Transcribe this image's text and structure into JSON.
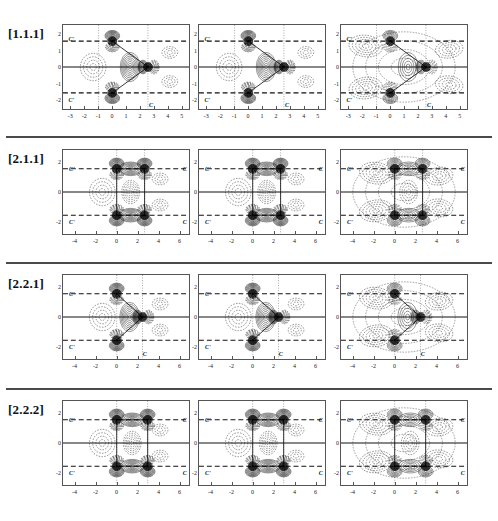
{
  "figure": {
    "rows": [
      {
        "label": "[1.1.1]",
        "xticks": [
          "-3",
          "-2",
          "-1",
          "0",
          "1",
          "2",
          "3",
          "4",
          "5"
        ],
        "xtick_values": [
          -3,
          -2,
          -1,
          0,
          1,
          2,
          3,
          4,
          5
        ],
        "yticks": [
          "2",
          "1",
          "0",
          "-1",
          "-2"
        ],
        "ytick_values": [
          2,
          1,
          0,
          -1,
          -2
        ],
        "xlim": [
          -3.6,
          5.6
        ],
        "ylim": [
          -2.6,
          2.6
        ],
        "annotations": [
          {
            "text": "C'",
            "x": -3.0,
            "y": 1.75
          },
          {
            "text": "C'",
            "x": -3.0,
            "y": -1.95
          },
          {
            "text": "C",
            "x": 2.72,
            "y": -2.25
          }
        ],
        "panels": [
          {
            "name": "panel-1-1",
            "style": "tight-triangle"
          },
          {
            "name": "panel-1-2",
            "style": "tight-triangle"
          },
          {
            "name": "panel-1-3",
            "style": "diffuse-triangle"
          }
        ]
      },
      {
        "label": "[2.1.1]",
        "xticks": [
          "-4",
          "-2",
          "0",
          "2",
          "4",
          "6"
        ],
        "xtick_values": [
          -4,
          -2,
          0,
          2,
          4,
          6
        ],
        "yticks": [
          "2",
          "0",
          "-2"
        ],
        "ytick_values": [
          2,
          0,
          -2
        ],
        "xlim": [
          -5.2,
          7.0
        ],
        "ylim": [
          -2.9,
          2.9
        ],
        "annotations": [
          {
            "text": "C'",
            "x": -4.35,
            "y": 1.62
          },
          {
            "text": "C'",
            "x": -4.35,
            "y": -1.95
          },
          {
            "text": "C",
            "x": 6.4,
            "y": 1.62
          },
          {
            "text": "C",
            "x": 6.4,
            "y": -1.95
          }
        ],
        "panels": [
          {
            "name": "panel-2-1",
            "style": "tight-rect"
          },
          {
            "name": "panel-2-2",
            "style": "tight-rect"
          },
          {
            "name": "panel-2-3",
            "style": "diffuse-rect"
          }
        ]
      },
      {
        "label": "[2.2.1]",
        "xticks": [
          "-4",
          "-2",
          "0",
          "2",
          "4",
          "6"
        ],
        "xtick_values": [
          -4,
          -2,
          0,
          2,
          4,
          6
        ],
        "yticks": [
          "2",
          "0",
          "-2"
        ],
        "ytick_values": [
          2,
          0,
          -2
        ],
        "xlim": [
          -5.2,
          7.0
        ],
        "ylim": [
          -2.9,
          2.9
        ],
        "annotations": [
          {
            "text": "C'",
            "x": -4.35,
            "y": 1.62
          },
          {
            "text": "C'",
            "x": -4.35,
            "y": -1.95
          },
          {
            "text": "C",
            "x": 2.6,
            "y": -2.45
          }
        ],
        "panels": [
          {
            "name": "panel-3-1",
            "style": "tight-triangle2"
          },
          {
            "name": "panel-3-2",
            "style": "tight-triangle2"
          },
          {
            "name": "panel-3-3",
            "style": "diffuse-triangle2"
          }
        ]
      },
      {
        "label": "[2.2.2]",
        "xticks": [
          "-4",
          "-2",
          "0",
          "2",
          "4",
          "6"
        ],
        "xtick_values": [
          -4,
          -2,
          0,
          2,
          4,
          6
        ],
        "yticks": [
          "2",
          "0",
          "-2"
        ],
        "ytick_values": [
          2,
          0,
          -2
        ],
        "xlim": [
          -5.2,
          7.0
        ],
        "ylim": [
          -2.9,
          2.9
        ],
        "annotations": [
          {
            "text": "C'",
            "x": -4.35,
            "y": 1.62
          },
          {
            "text": "C'",
            "x": -4.35,
            "y": -1.95
          },
          {
            "text": "C",
            "x": 6.4,
            "y": 1.62
          },
          {
            "text": "C",
            "x": 6.4,
            "y": -1.95
          }
        ],
        "panels": [
          {
            "name": "panel-4-1",
            "style": "tight-rect2"
          },
          {
            "name": "panel-4-2",
            "style": "tight-rect2"
          },
          {
            "name": "panel-4-3",
            "style": "diffuse-rect2"
          }
        ]
      }
    ]
  },
  "chart_data": {
    "type": "contour",
    "title": "",
    "xlabel": "",
    "ylabel": "",
    "grid": false,
    "legend": null,
    "rows": [
      {
        "label": "[1.1.1]",
        "xlim": [
          -3.6,
          5.6
        ],
        "ylim": [
          -2.6,
          2.6
        ],
        "xticks": [
          -3,
          -2,
          -1,
          0,
          1,
          2,
          3,
          4,
          5
        ],
        "yticks": [
          2,
          1,
          0,
          -1,
          -2
        ],
        "molecule": "triangle",
        "atoms": [
          {
            "label": "C'",
            "x": 0.0,
            "y": 1.6
          },
          {
            "label": "C'",
            "x": 0.0,
            "y": -1.6
          },
          {
            "label": "C",
            "x": 2.6,
            "y": 0.0
          }
        ],
        "bonds": [
          [
            0,
            2
          ],
          [
            1,
            2
          ]
        ],
        "reference_lines": {
          "dashed_horizontal": [
            1.6,
            -1.6
          ],
          "dotted_vertical": [
            -1.0,
            2.6
          ],
          "solid_horizontal": [
            0.0
          ]
        },
        "columns": [
          "contracted",
          "contracted",
          "diffuse"
        ]
      },
      {
        "label": "[2.1.1]",
        "xlim": [
          -5.2,
          7.0
        ],
        "ylim": [
          -2.9,
          2.9
        ],
        "xticks": [
          -4,
          -2,
          0,
          2,
          4,
          6
        ],
        "yticks": [
          2,
          0,
          -2
        ],
        "molecule": "rectangle",
        "atoms": [
          {
            "label": "C'",
            "x": 0.0,
            "y": 1.6
          },
          {
            "label": "C'",
            "x": 0.0,
            "y": -1.6
          },
          {
            "label": "C",
            "x": 2.7,
            "y": 1.6
          },
          {
            "label": "C",
            "x": 2.7,
            "y": -1.6
          }
        ],
        "bonds": [
          [
            0,
            2
          ],
          [
            1,
            3
          ],
          [
            0,
            1
          ],
          [
            2,
            3
          ]
        ],
        "reference_lines": {
          "dashed_horizontal": [
            1.6,
            -1.6
          ],
          "dotted_vertical": [
            0.0,
            2.7
          ],
          "solid_horizontal": [
            0.0
          ]
        },
        "columns": [
          "contracted",
          "contracted",
          "diffuse"
        ]
      },
      {
        "label": "[2.2.1]",
        "xlim": [
          -5.2,
          7.0
        ],
        "ylim": [
          -2.9,
          2.9
        ],
        "xticks": [
          -4,
          -2,
          0,
          2,
          4,
          6
        ],
        "yticks": [
          2,
          0,
          -2
        ],
        "molecule": "triangle",
        "atoms": [
          {
            "label": "C'",
            "x": 0.0,
            "y": 1.6
          },
          {
            "label": "C'",
            "x": 0.0,
            "y": -1.6
          },
          {
            "label": "C",
            "x": 2.5,
            "y": 0.0
          }
        ],
        "bonds": [
          [
            0,
            2
          ],
          [
            1,
            2
          ]
        ],
        "reference_lines": {
          "dashed_horizontal": [
            1.6,
            -1.6
          ],
          "dotted_vertical": [
            0.0,
            2.5
          ],
          "solid_horizontal": [
            0.0
          ]
        },
        "columns": [
          "contracted",
          "contracted",
          "diffuse"
        ]
      },
      {
        "label": "[2.2.2]",
        "xlim": [
          -5.2,
          7.0
        ],
        "ylim": [
          -2.9,
          2.9
        ],
        "xticks": [
          -4,
          -2,
          0,
          2,
          4,
          6
        ],
        "yticks": [
          2,
          0,
          -2
        ],
        "molecule": "rectangle",
        "atoms": [
          {
            "label": "C'",
            "x": 0.0,
            "y": 1.6
          },
          {
            "label": "C'",
            "x": 0.0,
            "y": -1.6
          },
          {
            "label": "C",
            "x": 3.0,
            "y": 1.6
          },
          {
            "label": "C",
            "x": 3.0,
            "y": -1.6
          }
        ],
        "bonds": [
          [
            0,
            2
          ],
          [
            1,
            3
          ],
          [
            0,
            1
          ],
          [
            2,
            3
          ]
        ],
        "reference_lines": {
          "dashed_horizontal": [
            1.6,
            -1.6
          ],
          "dotted_vertical": [
            0.0,
            3.0
          ],
          "solid_horizontal": [
            0.0
          ]
        },
        "columns": [
          "contracted",
          "contracted",
          "diffuse"
        ]
      }
    ],
    "colors": {
      "contour_positive": "#111111",
      "contour_negative": "#333333",
      "frame": "#555555",
      "separator": "#4a4a4a"
    }
  }
}
